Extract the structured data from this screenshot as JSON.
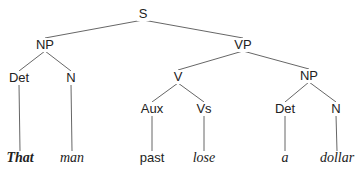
{
  "diagram": {
    "type": "syntax-tree",
    "nodes": {
      "s": {
        "label": "S",
        "x": 143,
        "y": 14
      },
      "np1": {
        "label": "NP",
        "x": 45,
        "y": 45
      },
      "vp": {
        "label": "VP",
        "x": 243,
        "y": 45
      },
      "det1": {
        "label": "Det",
        "x": 19,
        "y": 78
      },
      "n1": {
        "label": "N",
        "x": 71,
        "y": 78
      },
      "v": {
        "label": "V",
        "x": 178,
        "y": 77
      },
      "np2": {
        "label": "NP",
        "x": 309,
        "y": 76
      },
      "aux": {
        "label": "Aux",
        "x": 152,
        "y": 109
      },
      "vs": {
        "label": "Vs",
        "x": 204,
        "y": 109
      },
      "det2": {
        "label": "Det",
        "x": 285,
        "y": 109
      },
      "n2": {
        "label": "N",
        "x": 336,
        "y": 109
      },
      "that": {
        "label": "That",
        "x": 20,
        "y": 158
      },
      "man": {
        "label": "man",
        "x": 72,
        "y": 158
      },
      "past": {
        "label": "past",
        "x": 152,
        "y": 158
      },
      "lose": {
        "label": "lose",
        "x": 204,
        "y": 158
      },
      "a": {
        "label": "a",
        "x": 285,
        "y": 158
      },
      "dollar": {
        "label": "dollar",
        "x": 337,
        "y": 158
      }
    },
    "edges": [
      [
        "s",
        "np1"
      ],
      [
        "s",
        "vp"
      ],
      [
        "np1",
        "det1"
      ],
      [
        "np1",
        "n1"
      ],
      [
        "vp",
        "v"
      ],
      [
        "vp",
        "np2"
      ],
      [
        "v",
        "aux"
      ],
      [
        "v",
        "vs"
      ],
      [
        "np2",
        "det2"
      ],
      [
        "np2",
        "n2"
      ],
      [
        "det1",
        "that"
      ],
      [
        "n1",
        "man"
      ],
      [
        "aux",
        "past"
      ],
      [
        "vs",
        "lose"
      ],
      [
        "det2",
        "a"
      ],
      [
        "n2",
        "dollar"
      ]
    ]
  }
}
